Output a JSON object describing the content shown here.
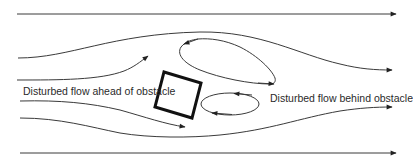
{
  "diagram": {
    "type": "flow-around-obstacle",
    "labels": {
      "ahead": "Disturbed flow ahead of obstacle",
      "behind": "Disturbed flow behind obstacle"
    },
    "colors": {
      "line": "#3a3a3a",
      "obstacle": "#111111",
      "background": "#ffffff"
    },
    "elements": {
      "streamlines": 6,
      "eddies": 2,
      "obstacle": "tilted square"
    }
  }
}
